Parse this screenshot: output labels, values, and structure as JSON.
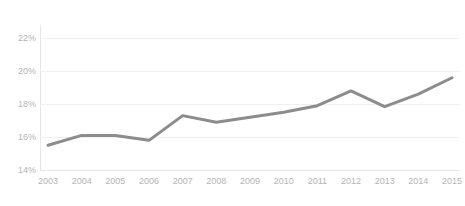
{
  "chart_data": {
    "type": "line",
    "title": "",
    "xlabel": "",
    "ylabel": "",
    "categories": [
      "2003",
      "2004",
      "2005",
      "2006",
      "2007",
      "2008",
      "2009",
      "2010",
      "2011",
      "2012",
      "2013",
      "2014",
      "2015"
    ],
    "x": [
      2003,
      2004,
      2005,
      2006,
      2007,
      2008,
      2009,
      2010,
      2011,
      2012,
      2013,
      2014,
      2015
    ],
    "values": [
      15.5,
      16.1,
      16.1,
      15.8,
      17.3,
      16.9,
      17.2,
      17.5,
      17.9,
      18.8,
      17.85,
      18.6,
      19.6
    ],
    "series": [
      {
        "name": "",
        "values": [
          15.5,
          16.1,
          16.1,
          15.8,
          17.3,
          16.9,
          17.2,
          17.5,
          17.9,
          18.8,
          17.85,
          18.6,
          19.6
        ]
      }
    ],
    "ylim": [
      14,
      22.8
    ],
    "yticks": [
      14,
      16,
      18,
      20,
      22
    ],
    "ytick_labels": [
      "14%",
      "16%",
      "18%",
      "20%",
      "22%"
    ],
    "xtick_labels": [
      "2003",
      "2004",
      "2005",
      "2006",
      "2007",
      "2008",
      "2009",
      "2010",
      "2011",
      "2012",
      "2013",
      "2014",
      "2015"
    ],
    "grid": true,
    "legend": false,
    "legend_position": "none",
    "line_color": "#8c8c8c",
    "grid_color": "#f0f0f2",
    "axis_color": "#e6e6e9",
    "tick_label_color": "#b4b4b8"
  }
}
